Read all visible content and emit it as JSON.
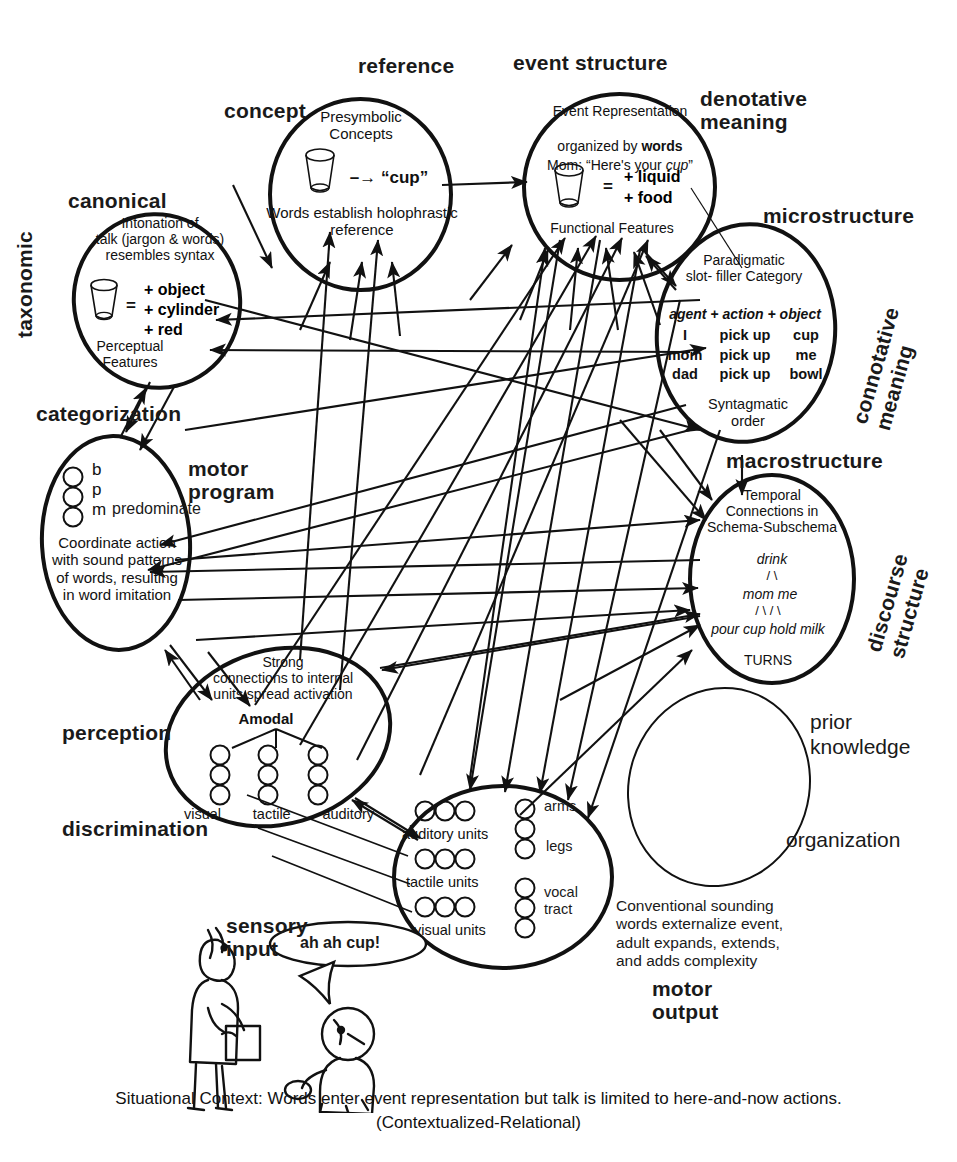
{
  "outer_labels": [
    {
      "key": "concept",
      "text": "concept",
      "x": 224,
      "y": 100,
      "size": "md",
      "rot": 0
    },
    {
      "key": "reference",
      "text": "reference",
      "x": 358,
      "y": 55,
      "size": "md",
      "rot": 0
    },
    {
      "key": "event_structure",
      "text": "event  structure",
      "x": 513,
      "y": 52,
      "size": "md",
      "rot": 0
    },
    {
      "key": "denotative_meaning",
      "text": "denotative\nmeaning",
      "x": 700,
      "y": 90,
      "size": "md",
      "rot": 0
    },
    {
      "key": "canonical",
      "text": "canonical",
      "x": 68,
      "y": 190,
      "size": "md",
      "rot": 0
    },
    {
      "key": "taxonomic",
      "text": "taxonomic",
      "x": 42,
      "y": 330,
      "size": "md",
      "rot": -90
    },
    {
      "key": "microstructure",
      "text": "microstructure",
      "x": 763,
      "y": 205,
      "size": "md",
      "rot": 0
    },
    {
      "key": "connotative_meaning",
      "text": "connotative\nmeaning",
      "x": 898,
      "y": 400,
      "size": "md",
      "rot": -72
    },
    {
      "key": "categorization",
      "text": "categorization",
      "x": 36,
      "y": 403,
      "size": "md",
      "rot": 0
    },
    {
      "key": "motor_program",
      "text": "motor\nprogram",
      "x": 188,
      "y": 460,
      "size": "md",
      "rot": 0
    },
    {
      "key": "macrostructure",
      "text": "macrostructure",
      "x": 726,
      "y": 452,
      "size": "md",
      "rot": 0
    },
    {
      "key": "discourse_structure",
      "text": "discourse\nstructure",
      "x": 906,
      "y": 640,
      "size": "md",
      "rot": -72
    },
    {
      "key": "perception",
      "text": "perception",
      "x": 70,
      "y": 725,
      "size": "md",
      "rot": 0
    },
    {
      "key": "discrimination",
      "text": "discrimination",
      "x": 70,
      "y": 820,
      "size": "md",
      "rot": 0
    },
    {
      "key": "sensory_input",
      "text": "sensory\ninput",
      "x": 226,
      "y": 917,
      "size": "md",
      "rot": 0
    },
    {
      "key": "motor_output",
      "text": "motor\noutput",
      "x": 655,
      "y": 980,
      "size": "md",
      "rot": 0
    }
  ],
  "plain_labels": [
    {
      "key": "prior_knowledge",
      "text": "prior\nknowledge",
      "x": 810,
      "y": 713,
      "size": 21
    },
    {
      "key": "organization",
      "text": "organization",
      "x": 790,
      "y": 831,
      "size": 21
    }
  ],
  "bubbles": {
    "concept": {
      "lines_top": "Presymbolic\nConcepts",
      "arrow_word": "–→  “cup”",
      "lines_bottom": "Words establish holophrastic\nreference"
    },
    "canonical": {
      "lines_top": "Intonation of\ntalk (jargon & words)\nresembles syntax",
      "eq": "=",
      "features": [
        "+ object",
        "+ cylinder",
        "+ red"
      ],
      "lines_bottom": "Perceptual\nFeatures"
    },
    "event_structure": {
      "l1": "Event Representation",
      "l2a": "organized by ",
      "l2b": "words",
      "l3a": "Mom:  “Here's your ",
      "l3b": "cup",
      "l3c": "”",
      "eq": "=",
      "features": [
        "+ liquid",
        "+ food"
      ],
      "lines_bottom": "Functional Features"
    },
    "microstructure": {
      "lines_top": "Paradigmatic\nslot- filler Category",
      "frame": "agent + action + object",
      "rows": [
        [
          "I",
          "pick up",
          "cup"
        ],
        [
          "mom",
          "pick up",
          "me"
        ],
        [
          "dad",
          "pick up",
          "bowl"
        ]
      ],
      "lines_bottom": "Syntagmatic\norder"
    },
    "macrostructure": {
      "lines_top": "Temporal\nConnections in\nSchema-Subschema",
      "tree_root": "drink",
      "tree_slashes1": "/        \\",
      "tree_mid": "mom    me",
      "tree_slashes2": "/     \\    /    \\",
      "tree_leaves": "pour  cup hold milk",
      "turns": "TURNS"
    },
    "categorization": {
      "phonemes": [
        "b",
        "p",
        "m"
      ],
      "predominate": "predominate",
      "lines_bottom": "Coordinate action\nwith sound patterns\nof words, resulting\nin word imitation"
    },
    "perception": {
      "lines_top": "Strong\nconnections to internal\nunits spread activation",
      "amodal": "Amodal",
      "modalities": [
        "visual",
        "tactile",
        "auditory"
      ]
    },
    "sensory_motor": {
      "left_units": [
        "auditory units",
        "tactile units",
        "visual units"
      ],
      "right_units": [
        "arms",
        "legs",
        "vocal\ntract"
      ]
    },
    "prior_knowledge": {
      "empty": true
    }
  },
  "figures": {
    "speech_bubble": "ah ah cup!",
    "note": "Conventional sounding\nwords externalize event,\nadult expands, extends,\nand adds complexity"
  },
  "caption": {
    "line1": "Situational Context:  Words enter event representation but talk is limited to here-and-now actions.",
    "line2": "(Contextualized-Relational)"
  },
  "colors": {
    "ink": "#111111",
    "paper": "#ffffff"
  }
}
